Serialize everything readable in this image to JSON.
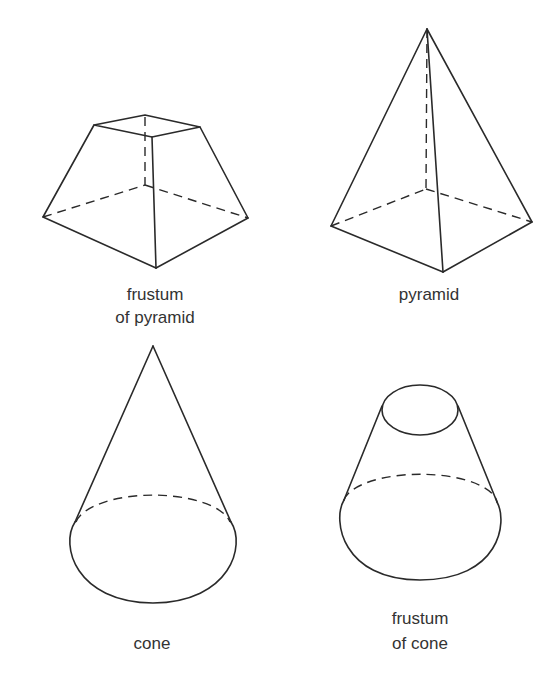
{
  "shapes": {
    "frustum_pyramid": {
      "label_line1": "frustum",
      "label_line2": "of pyramid"
    },
    "pyramid": {
      "label": "pyramid"
    },
    "cone": {
      "label": "cone"
    },
    "frustum_cone": {
      "label_line1": "frustum",
      "label_line2": "of cone"
    }
  },
  "colors": {
    "line": "#2a2a2a",
    "text": "#333333",
    "background": "#ffffff"
  }
}
